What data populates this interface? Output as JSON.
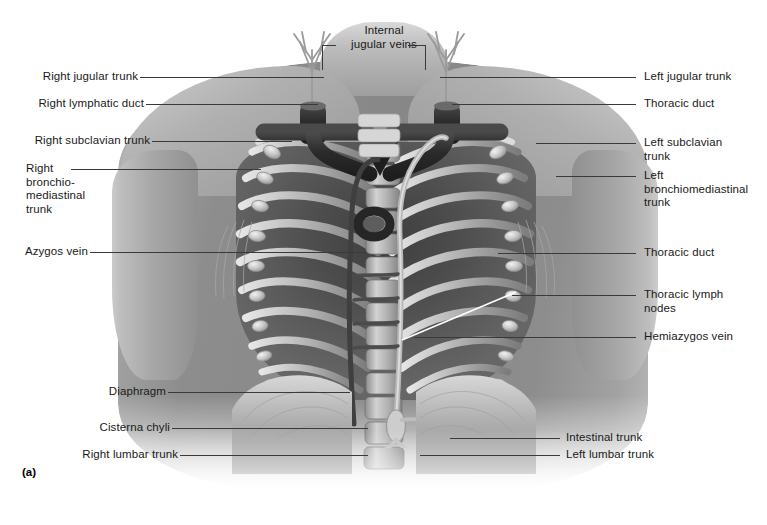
{
  "figure": {
    "marker": "(a)"
  },
  "labels": {
    "top_center": {
      "text": "Internal\njugular veins",
      "name": "internal-jugular-veins"
    },
    "left": [
      {
        "name": "right-jugular-trunk",
        "text": "Right jugular trunk"
      },
      {
        "name": "right-lymphatic-duct",
        "text": "Right lymphatic duct"
      },
      {
        "name": "right-subclavian-trunk",
        "text": "Right subclavian trunk"
      },
      {
        "name": "right-bronchomediastinal-trunk",
        "text": "Right\nbronchio-\nmediastinal\ntrunk"
      },
      {
        "name": "azygos-vein",
        "text": "Azygos vein"
      },
      {
        "name": "diaphragm",
        "text": "Diaphragm"
      },
      {
        "name": "cisterna-chyli",
        "text": "Cisterna chyli"
      },
      {
        "name": "right-lumbar-trunk",
        "text": "Right lumbar trunk"
      }
    ],
    "right": [
      {
        "name": "left-jugular-trunk",
        "text": "Left jugular trunk"
      },
      {
        "name": "thoracic-duct-upper",
        "text": "Thoracic duct"
      },
      {
        "name": "left-subclavian-trunk",
        "text": "Left subclavian\ntrunk"
      },
      {
        "name": "left-bronchomediastinal-trunk",
        "text": "Left\nbronchiomediastinal\ntrunk"
      },
      {
        "name": "thoracic-duct-lower",
        "text": "Thoracic duct"
      },
      {
        "name": "thoracic-lymph-nodes",
        "text": "Thoracic lymph\nnodes"
      },
      {
        "name": "hemiazygos-vein",
        "text": "Hemiazygos vein"
      },
      {
        "name": "intestinal-trunk",
        "text": "Intestinal trunk"
      },
      {
        "name": "left-lumbar-trunk",
        "text": "Left lumbar trunk"
      }
    ]
  },
  "colors": {
    "background": "#ffffff",
    "label_text": "#1a1a1a",
    "leader_line": "#3a3a3a",
    "skin_light": "#cfcfcf",
    "skin_mid": "#8a8a8a",
    "cavity_dark": "#4c4c4c",
    "vessel_dark": "#2e2e2e",
    "node_light": "#d8d8d8",
    "bone_light": "#e2e2e2"
  }
}
